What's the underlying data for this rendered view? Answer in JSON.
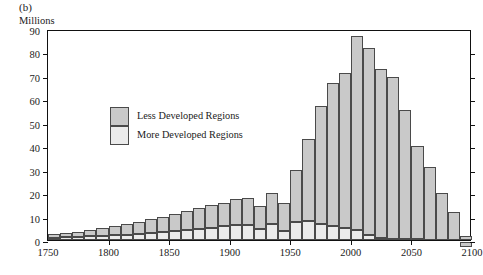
{
  "figure": {
    "panel_letter": "(b)",
    "unit_label": "Millions",
    "title": "Increase in numbers, by decade"
  },
  "legend": {
    "items": [
      {
        "label": "Less Developed Regions",
        "color": "#c9c9c9",
        "key": "less"
      },
      {
        "label": "More Developed Regions",
        "color": "#ebebeb",
        "key": "more"
      }
    ]
  },
  "chart_data": {
    "type": "bar",
    "title": "Increase in numbers, by decade",
    "subtitle": "(b)",
    "xlabel": "",
    "ylabel": "Millions",
    "xlim": [
      1750,
      2100
    ],
    "ylim": [
      0,
      90
    ],
    "ytick_step": 10,
    "xtick_step": 50,
    "grid": false,
    "stacked": true,
    "bar_interval_years": 10,
    "legend_position": "inside-upper-left",
    "yticks": [
      0,
      10,
      20,
      30,
      40,
      50,
      60,
      70,
      80,
      90
    ],
    "ytick_labels": [
      "0",
      "10",
      "20",
      "30",
      "40",
      "50",
      "60",
      "70",
      "80",
      "90"
    ],
    "xticks": [
      1750,
      1800,
      1850,
      1900,
      1950,
      2000,
      2050,
      2100
    ],
    "xtick_labels": [
      "1750",
      "1800",
      "1850",
      "1900",
      "1950",
      "2000",
      "2050",
      "2100"
    ],
    "categories": [
      1750,
      1760,
      1770,
      1780,
      1790,
      1800,
      1810,
      1820,
      1830,
      1840,
      1850,
      1860,
      1870,
      1880,
      1890,
      1900,
      1910,
      1920,
      1930,
      1940,
      1950,
      1960,
      1970,
      1980,
      1990,
      2000,
      2010,
      2020,
      2030,
      2040,
      2050,
      2060,
      2070,
      2080,
      2090
    ],
    "series": [
      {
        "name": "More Developed Regions",
        "color": "#ebebeb",
        "values": [
          1.0,
          1.1,
          1.3,
          1.5,
          1.7,
          2.0,
          2.3,
          2.7,
          3.1,
          3.5,
          3.9,
          4.3,
          4.8,
          5.3,
          5.8,
          6.3,
          6.6,
          4.5,
          7.0,
          4.0,
          7.6,
          8.0,
          7.0,
          5.8,
          5.2,
          4.4,
          2.0,
          1.0,
          0.6,
          0.4,
          0.3,
          0.2,
          0.1,
          0.0,
          0.0
        ]
      },
      {
        "name": "Less Developed Regions",
        "color": "#c9c9c9",
        "values": [
          1.5,
          1.9,
          2.3,
          2.8,
          3.3,
          3.8,
          4.4,
          5.1,
          5.8,
          6.5,
          7.3,
          8.1,
          8.8,
          9.5,
          10.2,
          11.0,
          11.4,
          10.0,
          13.0,
          12.0,
          22.4,
          35.0,
          50.0,
          61.2,
          66.0,
          82.8,
          80.0,
          72.0,
          69.0,
          55.0,
          40.0,
          31.0,
          20.0,
          12.0,
          1.5
        ]
      }
    ],
    "totals": [
      2.5,
      3.0,
      3.6,
      4.3,
      5.0,
      5.8,
      6.7,
      7.8,
      8.9,
      10.0,
      11.2,
      12.4,
      13.6,
      14.8,
      16.0,
      17.3,
      18.0,
      14.5,
      20.0,
      16.0,
      30.0,
      43.0,
      57.0,
      67.0,
      71.2,
      87.2,
      82.0,
      73.0,
      69.6,
      55.4,
      40.3,
      31.2,
      20.1,
      12.0,
      1.5
    ],
    "peak": {
      "year": 2000,
      "value": 87.2
    },
    "negative_bars": [
      {
        "year": 2090,
        "value": -2.0
      }
    ],
    "annotations": []
  }
}
